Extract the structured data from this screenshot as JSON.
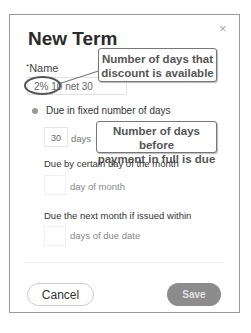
{
  "dialog": {
    "title": "New Term",
    "close_icon": "×",
    "name_label": "Name",
    "required_marker": "*",
    "name_value": "2% 10 net 30"
  },
  "options": {
    "fixed_days": {
      "label": "Due in fixed number of days",
      "value": "30",
      "unit": "days",
      "selected": true
    },
    "day_of_month": {
      "label": "Due by certain day of the month",
      "value": "",
      "suffix": "day of month"
    },
    "next_month": {
      "label": "Due the next month if issued within",
      "value": "",
      "suffix": "days of due date"
    }
  },
  "footer": {
    "cancel_label": "Cancel",
    "save_label": "Save"
  },
  "annotations": {
    "callout_discount": "Number of days that discount is available",
    "callout_discount_line1": "Number of days that",
    "callout_discount_line2": "discount is available",
    "callout_payment_line1": "Number of days before",
    "callout_payment_line2": "payment in full is due"
  }
}
